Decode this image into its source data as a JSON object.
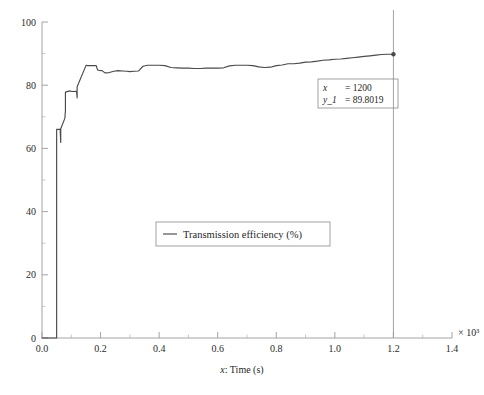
{
  "chart_data": {
    "type": "line",
    "title": "",
    "xlabel": "x: Time (s)",
    "ylabel": "",
    "x_multiplier": "× 10³",
    "xlim": [
      0.0,
      1.4
    ],
    "ylim": [
      0,
      100
    ],
    "x_ticks": [
      "0.0",
      "0.2",
      "0.4",
      "0.6",
      "0.8",
      "1.0",
      "1.2",
      "1.4"
    ],
    "x_tick_values": [
      0.0,
      0.2,
      0.4,
      0.6,
      0.8,
      1.0,
      1.2,
      1.4
    ],
    "y_ticks": [
      "0",
      "20",
      "40",
      "60",
      "80",
      "100"
    ],
    "y_tick_values": [
      0,
      20,
      40,
      60,
      80,
      100
    ],
    "grid": false,
    "legend_position": "center",
    "series": [
      {
        "name": "Transmission efficiency (%)",
        "color": "#4a4a4a",
        "x": [
          0,
          48,
          50,
          50,
          62,
          64,
          64,
          78,
          80,
          80,
          95,
          97,
          100,
          118,
          120,
          120,
          150,
          152,
          155,
          180,
          185,
          190,
          195,
          205,
          215,
          230,
          245,
          260,
          275,
          290,
          300,
          315,
          330,
          345,
          360,
          380,
          400,
          420,
          440,
          460,
          480,
          500,
          520,
          540,
          560,
          580,
          600,
          620,
          640,
          660,
          680,
          700,
          720,
          740,
          760,
          780,
          800,
          820,
          840,
          860,
          880,
          900,
          920,
          940,
          960,
          980,
          1000,
          1020,
          1040,
          1060,
          1080,
          1100,
          1120,
          1140,
          1160,
          1180,
          1200
        ],
        "y": [
          0,
          0,
          0,
          66.0,
          66.0,
          61.9,
          66.2,
          69.5,
          72.0,
          77.8,
          78.2,
          78.2,
          78.0,
          78.1,
          76.0,
          79.5,
          86.2,
          86.3,
          86.2,
          86.2,
          86.2,
          84.8,
          84.7,
          84.6,
          83.9,
          84.0,
          84.4,
          84.6,
          84.5,
          84.4,
          84.3,
          84.4,
          84.5,
          86.0,
          86.3,
          86.3,
          86.3,
          86.2,
          85.6,
          85.5,
          85.4,
          85.4,
          85.3,
          85.3,
          85.4,
          85.4,
          85.4,
          85.5,
          86.1,
          86.3,
          86.3,
          86.3,
          86.2,
          85.8,
          85.6,
          85.7,
          86.2,
          86.4,
          86.8,
          86.8,
          87.0,
          87.3,
          87.4,
          87.6,
          87.9,
          88.0,
          88.2,
          88.3,
          88.5,
          88.7,
          88.9,
          89.1,
          89.3,
          89.5,
          89.7,
          89.8,
          89.8019
        ]
      }
    ],
    "annotations": [
      {
        "type": "cursor",
        "x": 1200,
        "y": 89.8019,
        "marker": true
      }
    ]
  },
  "legend": {
    "entries": [
      {
        "label": "Transmission efficiency (%)"
      }
    ]
  },
  "datatip": {
    "x_symbol": "x",
    "x_equals": "= 1200",
    "y_symbol": "y_1",
    "y_equals": "= 89.8019"
  },
  "axes": {
    "x_axis_label": "x: Time (s)",
    "x_axis_label_italic": "x",
    "x_axis_label_rest": ": Time (s)",
    "x_multiplier": "× 10³"
  }
}
